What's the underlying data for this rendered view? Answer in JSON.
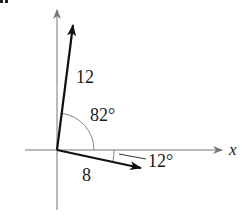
{
  "diagram": {
    "corner_mark": "▪▪",
    "axes": {
      "x_label": "x"
    },
    "vectors": [
      {
        "name": "vector-12",
        "magnitude_label": "12",
        "angle_label": "82°"
      },
      {
        "name": "vector-8",
        "magnitude_label": "8",
        "angle_label": "12°"
      }
    ],
    "colors": {
      "axis": "#777777",
      "vector": "#111111",
      "arc": "#888888"
    }
  }
}
